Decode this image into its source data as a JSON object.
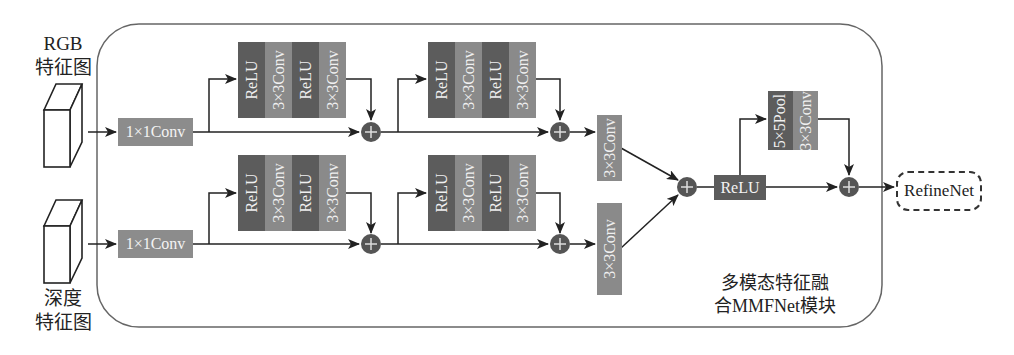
{
  "inputs": {
    "rgb": {
      "line1": "RGB",
      "line2": "特征图"
    },
    "depth": {
      "line1": "深度",
      "line2": "特征图"
    }
  },
  "module": {
    "title_line1": "多模态特征融",
    "title_line2": "合MMFNet模块"
  },
  "branches": {
    "top": {
      "conv1x1": "1×1Conv",
      "res_block_1": [
        "ReLU",
        "3×3Conv",
        "ReLU",
        "3×3Conv"
      ],
      "res_block_2": [
        "ReLU",
        "3×3Conv",
        "ReLU",
        "3×3Conv"
      ],
      "conv3x3": "3×3Conv"
    },
    "bottom": {
      "conv1x1": "1×1Conv",
      "res_block_1": [
        "ReLU",
        "3×3Conv",
        "ReLU",
        "3×3Conv"
      ],
      "res_block_2": [
        "ReLU",
        "3×3Conv",
        "ReLU",
        "3×3Conv"
      ],
      "conv3x3": "3×3Conv"
    }
  },
  "fusion": {
    "relu": "ReLU",
    "pool_block": [
      "5×5Pool",
      "3×3Conv"
    ],
    "plus_symbol": "+"
  },
  "output": {
    "label": "RefineNet"
  },
  "colors": {
    "dark_block": "#5c5c5c",
    "light_block": "#8a8a8a",
    "conv1x1": "#8c8c8c",
    "plus_node": "#555555",
    "line": "#222222",
    "frame": "#666666"
  }
}
